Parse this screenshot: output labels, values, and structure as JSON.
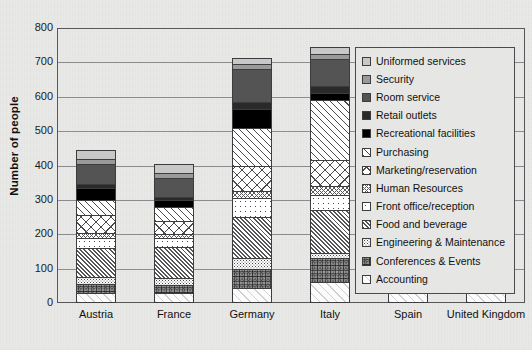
{
  "chart_data": {
    "type": "bar",
    "subtype": "stacked-bar",
    "title": "",
    "xlabel": "",
    "ylabel": "Number of people",
    "ylim": [
      0,
      800
    ],
    "ytick_values": [
      0,
      100,
      200,
      300,
      400,
      500,
      600,
      700,
      800
    ],
    "ytick_labels": [
      "0",
      "100",
      "200",
      "300",
      "400",
      "500",
      "600",
      "700",
      "800"
    ],
    "grid": true,
    "grid_axis": "y",
    "legend_position": "right-inside",
    "categories": [
      "Austria",
      "France",
      "Germany",
      "Italy",
      "Spain",
      "United Kingdom"
    ],
    "series": [
      {
        "name": "Accounting",
        "values": [
          30,
          28,
          45,
          60,
          30,
          28
        ]
      },
      {
        "name": "Conferences & Events",
        "values": [
          25,
          25,
          55,
          70,
          30,
          32
        ]
      },
      {
        "name": "Engineering & Maintenance",
        "values": [
          20,
          20,
          30,
          15,
          40,
          40
        ]
      },
      {
        "name": "Food and beverage",
        "values": [
          85,
          90,
          120,
          125,
          120,
          120
        ]
      },
      {
        "name": "Front office/reception",
        "values": [
          30,
          25,
          55,
          45,
          55,
          80
        ]
      },
      {
        "name": "Human Resources",
        "values": [
          15,
          12,
          20,
          25,
          20,
          20
        ]
      },
      {
        "name": "Marketing/reservation",
        "values": [
          50,
          40,
          75,
          75,
          55,
          50
        ]
      },
      {
        "name": "Purchasing",
        "values": [
          45,
          40,
          110,
          175,
          65,
          85
        ]
      },
      {
        "name": "Recreational facilities",
        "values": [
          35,
          20,
          55,
          20,
          65,
          60
        ]
      },
      {
        "name": "Retail outlets",
        "values": [
          10,
          8,
          20,
          20,
          15,
          15
        ]
      },
      {
        "name": "Room service",
        "values": [
          60,
          55,
          95,
          80,
          80,
          110
        ]
      },
      {
        "name": "Security",
        "values": [
          15,
          15,
          15,
          15,
          15,
          15
        ]
      },
      {
        "name": "Uniformed services",
        "values": [
          25,
          25,
          18,
          20,
          23,
          20
        ]
      }
    ],
    "totals": [
      445,
      403,
      713,
      745,
      613,
      675
    ]
  },
  "legend": {
    "items": [
      {
        "label": "Uniformed services",
        "swatch": "solid",
        "color": "#c8c8c8"
      },
      {
        "label": "Security",
        "swatch": "solid",
        "color": "#9a9a9a"
      },
      {
        "label": "Room service",
        "swatch": "solid",
        "color": "#545454"
      },
      {
        "label": "Retail outlets",
        "swatch": "solid",
        "color": "#2a2a2a"
      },
      {
        "label": "Recreational facilities",
        "swatch": "solid",
        "color": "#000000"
      },
      {
        "label": "Purchasing",
        "swatch": "diag-sparse",
        "color": "#ffffff"
      },
      {
        "label": "Marketing/reservation",
        "swatch": "cross-wide",
        "color": "#ffffff"
      },
      {
        "label": "Human Resources",
        "swatch": "cross-fine",
        "color": "#ffffff"
      },
      {
        "label": "Front office/reception",
        "swatch": "dots-sparse",
        "color": "#ffffff"
      },
      {
        "label": "Food and beverage",
        "swatch": "diag-dense",
        "color": "#ffffff"
      },
      {
        "label": "Engineering & Maintenance",
        "swatch": "speckle-light",
        "color": "#ffffff"
      },
      {
        "label": "Conferences & Events",
        "swatch": "speckle-dark",
        "color": "#c9c9c9"
      },
      {
        "label": "Accounting",
        "swatch": "faint-diag",
        "color": "#fcfcfc"
      }
    ]
  },
  "axes": {
    "y_title": "Number of people",
    "y_labels": [
      "800",
      "700",
      "600",
      "500",
      "400",
      "300",
      "200",
      "100",
      "0"
    ],
    "x_labels": [
      "Austria",
      "France",
      "Germany",
      "Italy",
      "Spain",
      "United Kingdom"
    ]
  },
  "colors": {
    "background": "#e9e9e7",
    "plot_border": "#58585a",
    "gridline": "#8c8c8e",
    "text": "#111111"
  }
}
